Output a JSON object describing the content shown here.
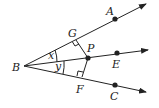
{
  "diagram": {
    "type": "geometry-angle-bisector",
    "vertex": "B",
    "rays": [
      {
        "name": "BA",
        "point_label": "A"
      },
      {
        "name": "BE",
        "point_label": "E"
      },
      {
        "name": "BC",
        "point_label": "C"
      }
    ],
    "points": {
      "A": "A",
      "B": "B",
      "C": "C",
      "E": "E",
      "P": "P",
      "G": "G",
      "F": "F"
    },
    "angles": {
      "upper": "x",
      "lower": "y"
    },
    "right_angle_marks": [
      "G",
      "F"
    ],
    "colors": {
      "stroke": "#222222",
      "background": "#ffffff"
    }
  }
}
